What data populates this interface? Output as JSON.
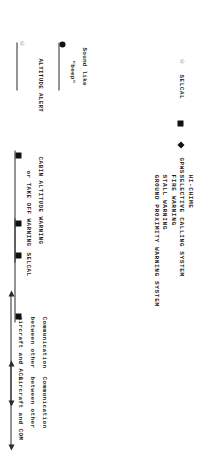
{
  "document": {
    "title": "Cockpit aural alerts and communication timeline"
  },
  "legend": {
    "items": [
      {
        "symbol": "star-icon",
        "label": "SELCAL"
      },
      {
        "symbol": "square-icon",
        "label": ""
      },
      {
        "symbol": "diamond-icon",
        "label": "GPWS"
      }
    ]
  },
  "systems": {
    "items": [
      "HI-CHIME",
      "SELECTIVE CALLING SYSTEM",
      "FIRE WARNING",
      "STALL WARNING",
      "GROUND PROXIMITY WARNING SYSTEM"
    ]
  },
  "segments": [
    {
      "id": "altitude-alert",
      "caption_lines": [
        "Sound like",
        "\"beep\""
      ],
      "secondary_caption": "ALTITUDE ALERT",
      "start_marker": "circle-icon",
      "end_marker": "star-icon"
    },
    {
      "id": "cabin-altitude-warning",
      "caption_lines": [
        "CABIN ALTITUDE WARNING",
        "or TAKE OFF WARNING"
      ],
      "start_marker": "square-icon",
      "end_marker": "square-icon"
    },
    {
      "id": "selcal",
      "caption_lines": [
        "SELCAL"
      ],
      "start_marker": "square-icon",
      "end_marker": "square-icon"
    },
    {
      "id": "comm-acc",
      "caption_lines": [
        "Communication",
        "between other",
        "aircraft and ACC"
      ],
      "start_marker": "arrow-left-icon",
      "end_marker": "arrow-right-icon"
    },
    {
      "id": "comm-com",
      "caption_lines": [
        "Communication",
        "between other",
        "aircraft and COM"
      ],
      "start_marker": "arrow-left-icon",
      "end_marker": "arrow-right-icon"
    }
  ],
  "colors": {
    "ink": "#1a1a1a",
    "rule": "#2b2b2b",
    "paper": "#ffffff"
  }
}
